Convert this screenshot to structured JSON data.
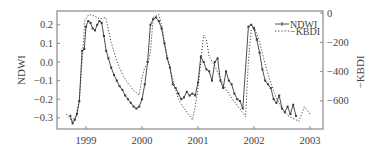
{
  "chart_data": {
    "type": "line",
    "title": "",
    "xlabel": "",
    "ylabel": "NDWI",
    "y2label": "−KBDI",
    "xlim": [
      1998.6,
      2003.15
    ],
    "ylim": [
      -0.36,
      0.275
    ],
    "y2lim": [
      -790,
      0
    ],
    "x_ticks": [
      1999,
      2000,
      2001,
      2002,
      2003
    ],
    "x_tick_labels": [
      "1999",
      "2000",
      "2001",
      "2002",
      "2003"
    ],
    "y_ticks": [
      0.2,
      0.1,
      0.0,
      -0.1,
      -0.2,
      -0.3
    ],
    "y_tick_labels": [
      "0.2",
      "0.1",
      "0.0",
      "−0.1",
      "−0.2",
      "−0.3"
    ],
    "y2_ticks": [
      0,
      -200,
      -400,
      -600
    ],
    "y2_tick_labels": [
      "0",
      "−200",
      "−400",
      "−600"
    ],
    "grid": false,
    "legend_position": "upper right",
    "legend": [
      "NDWI",
      "−KBDI"
    ],
    "series": [
      {
        "name": "NDWI",
        "axis": "left",
        "style": "solid-with-markers",
        "x": [
          1998.72,
          1998.76,
          1998.8,
          1998.84,
          1998.88,
          1998.93,
          1998.97,
          1999.0,
          1999.04,
          1999.08,
          1999.12,
          1999.16,
          1999.2,
          1999.24,
          1999.28,
          1999.32,
          1999.36,
          1999.4,
          1999.45,
          1999.5,
          1999.55,
          1999.6,
          1999.65,
          1999.7,
          1999.75,
          1999.8,
          1999.85,
          1999.9,
          1999.95,
          2000.0,
          2000.05,
          2000.1,
          2000.15,
          2000.2,
          2000.25,
          2000.3,
          2000.35,
          2000.4,
          2000.45,
          2000.5,
          2000.55,
          2000.6,
          2000.65,
          2000.7,
          2000.75,
          2000.8,
          2000.85,
          2000.9,
          2000.95,
          2001.0,
          2001.05,
          2001.1,
          2001.15,
          2001.2,
          2001.25,
          2001.3,
          2001.35,
          2001.4,
          2001.45,
          2001.5,
          2001.55,
          2001.6,
          2001.65,
          2001.7,
          2001.75,
          2001.8,
          2001.9,
          2001.95,
          2002.0,
          2002.05,
          2002.1,
          2002.15,
          2002.2,
          2002.25,
          2002.3,
          2002.35,
          2002.4,
          2002.45,
          2002.5,
          2002.55,
          2002.6,
          2002.65,
          2002.7,
          2002.75
        ],
        "y": [
          -0.29,
          -0.33,
          -0.31,
          -0.28,
          -0.21,
          0.06,
          0.07,
          0.19,
          0.22,
          0.21,
          0.18,
          0.17,
          0.2,
          0.22,
          0.21,
          0.14,
          0.06,
          0.02,
          -0.03,
          -0.07,
          -0.1,
          -0.13,
          -0.15,
          -0.18,
          -0.2,
          -0.22,
          -0.24,
          -0.25,
          -0.24,
          -0.2,
          -0.12,
          0.0,
          0.2,
          0.23,
          0.24,
          0.22,
          0.18,
          0.1,
          0.02,
          -0.03,
          -0.12,
          -0.14,
          -0.17,
          -0.2,
          -0.19,
          -0.16,
          -0.18,
          -0.17,
          -0.18,
          -0.11,
          0.03,
          0.0,
          -0.04,
          -0.05,
          -0.1,
          0.0,
          0.02,
          -0.1,
          -0.14,
          -0.05,
          -0.1,
          -0.12,
          -0.17,
          -0.2,
          -0.21,
          -0.25,
          0.19,
          0.2,
          0.18,
          0.12,
          0.05,
          -0.04,
          -0.1,
          -0.12,
          -0.14,
          -0.2,
          -0.22,
          -0.18,
          -0.25,
          -0.27,
          -0.24,
          -0.28,
          -0.23,
          -0.29
        ]
      },
      {
        "name": "−KBDI",
        "axis": "right",
        "style": "dotted",
        "x": [
          1998.65,
          1998.75,
          1998.82,
          1998.88,
          1998.93,
          1998.98,
          1999.05,
          1999.15,
          1999.25,
          1999.35,
          1999.45,
          1999.55,
          1999.65,
          1999.75,
          1999.85,
          1999.95,
          2000.0,
          2000.05,
          2000.1,
          2000.15,
          2000.2,
          2000.3,
          2000.35,
          2000.45,
          2000.55,
          2000.65,
          2000.75,
          2000.85,
          2000.9,
          2000.95,
          2001.0,
          2001.05,
          2001.1,
          2001.15,
          2001.2,
          2001.3,
          2001.4,
          2001.5,
          2001.6,
          2001.7,
          2001.8,
          2001.85,
          2001.9,
          2001.95,
          2002.0,
          2002.1,
          2002.2,
          2002.3,
          2002.4,
          2002.5,
          2002.6,
          2002.7,
          2002.8,
          2002.9,
          2003.0
        ],
        "y": [
          -690,
          -740,
          -700,
          -600,
          -330,
          -50,
          -10,
          -20,
          -40,
          -30,
          -200,
          -330,
          -420,
          -480,
          -530,
          -560,
          -440,
          -370,
          -350,
          -270,
          -30,
          -10,
          -80,
          -300,
          -450,
          -590,
          -650,
          -700,
          -730,
          -640,
          -520,
          -330,
          -150,
          -180,
          -300,
          -360,
          -450,
          -520,
          -580,
          -630,
          -680,
          -710,
          -330,
          -120,
          -90,
          -200,
          -350,
          -480,
          -580,
          -650,
          -700,
          -720,
          -740,
          -640,
          -690
        ]
      }
    ]
  },
  "legend": {
    "ndwi_label": "NDWI",
    "kbdi_label": "−KBDI"
  },
  "axes": {
    "left_title": "NDWI",
    "right_title": "−KBDI"
  },
  "colors": {
    "line": "#3a3a3a",
    "frame": "#888888",
    "text": "#444444"
  }
}
